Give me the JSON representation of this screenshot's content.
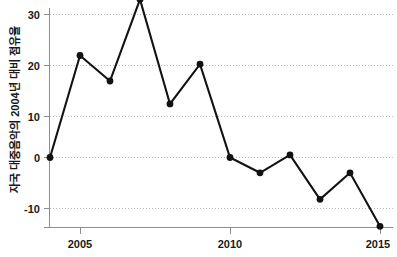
{
  "chart_data": {
    "type": "line",
    "title": "",
    "subtitle": "",
    "xlabel": "",
    "ylabel": "자국 대중음악의 2004년 대비 점유율",
    "x": [
      2004,
      2005,
      2006,
      2007,
      2008,
      2009,
      2010,
      2011,
      2012,
      2013,
      2014,
      2015
    ],
    "values": [
      0,
      20,
      15,
      31,
      10.5,
      18.3,
      0,
      -3,
      0.5,
      -8.2,
      -3,
      -13.5
    ],
    "series": [
      {
        "name": "자국 대중음악의 2004년 대비 점유율",
        "values": [
          0,
          20,
          15,
          31,
          10.5,
          18.3,
          0,
          -3,
          0.5,
          -8.2,
          -3,
          -13.5
        ]
      }
    ],
    "xlim": [
      2003.6,
      2015.4
    ],
    "ylim": [
      -16,
      33
    ],
    "x_ticks": [
      2005,
      2010,
      2015
    ],
    "x_tick_labels": [
      "2005",
      "2010",
      "2015"
    ],
    "y_ticks": [
      30,
      20,
      10,
      0,
      -10
    ],
    "y_tick_labels": [
      "30",
      "20",
      "10",
      "0",
      "-10"
    ],
    "grid": true,
    "grid_axis": "y",
    "legend": false,
    "legend_position": "none",
    "marker": "circle",
    "line_color": "#121212",
    "marker_color": "#121212",
    "grid_color": "#b9b9c4",
    "axis_color": "#8d8d97",
    "text_color": "#1a1a1a",
    "background_color": "#ffffff",
    "annotations": []
  },
  "axes": {
    "y_title": "자국 대중음악의 2004년 대비 점유율",
    "y_ticks": [
      "30",
      "20",
      "10",
      "0",
      "-10"
    ],
    "x_ticks": [
      "2005",
      "2010",
      "2015"
    ]
  }
}
